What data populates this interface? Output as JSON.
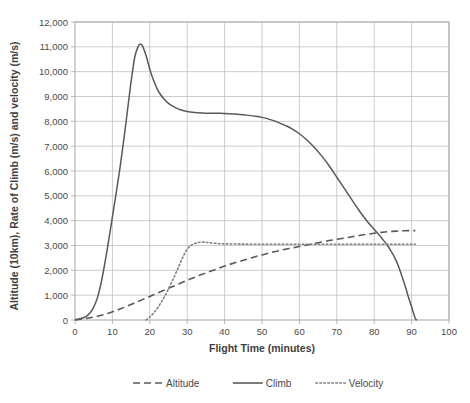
{
  "chart_data": {
    "type": "line",
    "title": "",
    "xlabel": "Flight Time (minutes)",
    "ylabel": "Altitude (10km), Rate of Climb (m/s) and velocity (m/s)",
    "xlim": [
      0,
      100
    ],
    "ylim": [
      0,
      12000
    ],
    "xticks": [
      0,
      10,
      20,
      30,
      40,
      50,
      60,
      70,
      80,
      90,
      100
    ],
    "xtick_labels": [
      "0",
      "10",
      "20",
      "30",
      "40",
      "50",
      "60",
      "70",
      "80",
      "90",
      "100"
    ],
    "yticks": [
      0,
      1000,
      2000,
      3000,
      4000,
      5000,
      6000,
      7000,
      8000,
      9000,
      10000,
      11000,
      12000
    ],
    "ytick_labels": [
      "0",
      "1,000",
      "2,000",
      "3,000",
      "4,000",
      "5,000",
      "6,000",
      "7,000",
      "8,000",
      "9,000",
      "10,000",
      "11,000",
      "12,000"
    ],
    "grid": "horizontal-and-vertical",
    "legend_position": "bottom",
    "plot_background": "#ffffff",
    "grid_color": "#bfbfbf",
    "border_color": "#a6a6a6",
    "series": [
      {
        "name": "Altitude",
        "style": "dashed",
        "color": "#595959",
        "x": [
          0,
          2,
          4,
          6,
          8,
          10,
          12,
          14,
          16,
          18,
          20,
          22,
          24,
          26,
          28,
          30,
          32,
          34,
          36,
          38,
          40,
          42,
          44,
          46,
          48,
          50,
          52,
          54,
          56,
          58,
          60,
          62,
          64,
          66,
          68,
          70,
          72,
          74,
          76,
          78,
          80,
          82,
          84,
          86,
          88,
          90,
          91
        ],
        "y": [
          0,
          40,
          90,
          150,
          230,
          330,
          440,
          560,
          690,
          820,
          950,
          1080,
          1210,
          1340,
          1470,
          1600,
          1720,
          1840,
          1950,
          2060,
          2170,
          2270,
          2360,
          2450,
          2540,
          2620,
          2700,
          2770,
          2840,
          2900,
          2960,
          3020,
          3080,
          3140,
          3200,
          3250,
          3300,
          3350,
          3400,
          3450,
          3490,
          3530,
          3560,
          3580,
          3595,
          3600,
          3600
        ]
      },
      {
        "name": "Climb",
        "style": "solid",
        "color": "#595959",
        "x": [
          0,
          1,
          2,
          3,
          4,
          5,
          6,
          7,
          8,
          9,
          10,
          11,
          12,
          13,
          14,
          15,
          16,
          17,
          17.5,
          18,
          19,
          20,
          21,
          22,
          23,
          24,
          25,
          26,
          27,
          28,
          30,
          32,
          34,
          36,
          38,
          40,
          42,
          44,
          46,
          48,
          50,
          52,
          54,
          56,
          58,
          60,
          62,
          64,
          66,
          68,
          70,
          72,
          74,
          76,
          78,
          80,
          82,
          84,
          86,
          88,
          89,
          90,
          91,
          91.5
        ],
        "y": [
          20,
          40,
          80,
          150,
          280,
          520,
          900,
          1500,
          2300,
          3200,
          4150,
          5100,
          6100,
          7200,
          8400,
          9600,
          10600,
          11050,
          11100,
          11050,
          10650,
          10100,
          9650,
          9300,
          9050,
          8870,
          8720,
          8620,
          8540,
          8480,
          8400,
          8360,
          8340,
          8330,
          8325,
          8320,
          8300,
          8280,
          8250,
          8210,
          8160,
          8080,
          7980,
          7850,
          7700,
          7500,
          7250,
          6950,
          6600,
          6200,
          5750,
          5300,
          4850,
          4400,
          4000,
          3650,
          3300,
          2900,
          2350,
          1500,
          1000,
          520,
          60,
          0
        ]
      },
      {
        "name": "Velocity",
        "style": "dotted",
        "color": "#7f7f7f",
        "x": [
          19,
          20,
          21,
          22,
          23,
          24,
          25,
          26,
          27,
          28,
          29,
          30,
          31,
          32,
          33,
          34,
          35,
          36,
          38,
          40,
          45,
          50,
          55,
          60,
          65,
          70,
          75,
          80,
          85,
          88,
          90,
          91
        ],
        "y": [
          0,
          120,
          280,
          470,
          700,
          960,
          1250,
          1570,
          1900,
          2250,
          2580,
          2850,
          3000,
          3080,
          3120,
          3140,
          3130,
          3110,
          3080,
          3065,
          3055,
          3050,
          3048,
          3048,
          3048,
          3050,
          3050,
          3050,
          3050,
          3050,
          3050,
          3050
        ]
      }
    ],
    "legend": [
      {
        "label": "Altitude",
        "style": "dashed",
        "color": "#595959"
      },
      {
        "label": "Climb",
        "style": "solid",
        "color": "#595959"
      },
      {
        "label": "Velocity",
        "style": "dotted",
        "color": "#7f7f7f"
      }
    ]
  }
}
